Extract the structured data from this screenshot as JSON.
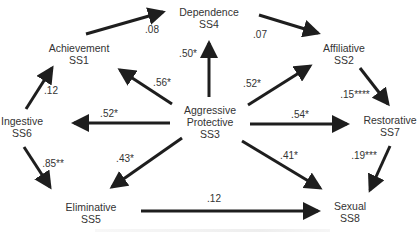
{
  "nodes": {
    "ss4": {
      "name": "Dependence",
      "code": "SS4"
    },
    "ss1": {
      "name": "Achievement",
      "code": "SS1"
    },
    "ss2": {
      "name": "Affiliative",
      "code": "SS2"
    },
    "ss6": {
      "name": "Ingestive",
      "code": "SS6"
    },
    "ss3": {
      "name1": "Aggressive",
      "name2": "Protective",
      "code": "SS3"
    },
    "ss7": {
      "name": "Restorative",
      "code": "SS7"
    },
    "ss5": {
      "name": "Eliminative",
      "code": "SS5"
    },
    "ss8": {
      "name": "Sexual",
      "code": "SS8"
    }
  },
  "edges": [
    {
      "from": "SS1",
      "to": "SS4",
      "weight": ".08"
    },
    {
      "from": "SS4",
      "to": "SS2",
      "weight": ".07"
    },
    {
      "from": "SS3",
      "to": "SS4",
      "weight": ".50*"
    },
    {
      "from": "SS3",
      "to": "SS1",
      "weight": ".56*"
    },
    {
      "from": "SS3",
      "to": "SS2",
      "weight": ".52*"
    },
    {
      "from": "SS6",
      "to": "SS1",
      "weight": ".12"
    },
    {
      "from": "SS3",
      "to": "SS6",
      "weight": ".52*"
    },
    {
      "from": "SS3",
      "to": "SS7",
      "weight": ".54*"
    },
    {
      "from": "SS2",
      "to": "SS7",
      "weight": ".15****"
    },
    {
      "from": "SS6",
      "to": "SS5",
      "weight": ".85**"
    },
    {
      "from": "SS3",
      "to": "SS5",
      "weight": ".43*"
    },
    {
      "from": "SS3",
      "to": "SS8",
      "weight": ".41*"
    },
    {
      "from": "SS7",
      "to": "SS8",
      "weight": ".19***"
    },
    {
      "from": "SS5",
      "to": "SS8",
      "weight": ".12"
    }
  ],
  "colors": {
    "arrow": "#1e1e1e",
    "text": "#333333",
    "background": "#ffffff"
  }
}
